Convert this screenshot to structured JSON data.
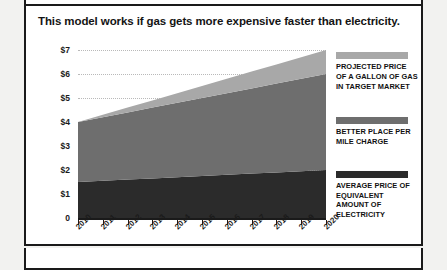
{
  "title": "This model works if gas gets more expensive faster than electricity.",
  "colors": {
    "gas": "#a8a8a8",
    "charge": "#6e6e6e",
    "electricity": "#2b2b2b",
    "gridline": "#b9b9b9",
    "axis": "#1a1a1a",
    "card_background": "#ffffff",
    "page_background": "#f2f2f0"
  },
  "legend": [
    {
      "key": "gas",
      "swatch": "#a8a8a8",
      "label": "PROJECTED PRICE OF A GALLON OF GAS IN TARGET MARKET"
    },
    {
      "key": "charge",
      "swatch": "#6e6e6e",
      "label": "BETTER PLACE PER MILE CHARGE"
    },
    {
      "key": "electricity",
      "swatch": "#2b2b2b",
      "label": "AVERAGE PRICE OF EQUIVALENT AMOUNT OF ELECTRICITY"
    }
  ],
  "chart_data": {
    "type": "area",
    "stacked": true,
    "title": "This model works if gas gets more expensive faster than electricity.",
    "xlabel": "",
    "ylabel": "",
    "categories": [
      "2010",
      "2011",
      "2012",
      "2013",
      "2014",
      "2015",
      "2016",
      "2017",
      "2018",
      "2019",
      "2020"
    ],
    "x": [
      2010,
      2011,
      2012,
      2013,
      2014,
      2015,
      2016,
      2017,
      2018,
      2019,
      2020
    ],
    "ylim": [
      0,
      7
    ],
    "xlim": [
      2010,
      2020
    ],
    "y_ticks": [
      0,
      1,
      2,
      3,
      4,
      5,
      6,
      7
    ],
    "y_tick_labels": [
      "0",
      "$1",
      "$2",
      "$3",
      "$4",
      "$5",
      "$6",
      "$7"
    ],
    "grid": true,
    "grid_axis": "y",
    "legend_position": "right",
    "series": [
      {
        "name": "AVERAGE PRICE OF EQUIVALENT AMOUNT OF ELECTRICITY",
        "color": "#2b2b2b",
        "values": [
          1.5,
          1.55,
          1.6,
          1.65,
          1.7,
          1.75,
          1.8,
          1.85,
          1.9,
          1.95,
          2.0
        ]
      },
      {
        "name": "BETTER PLACE PER MILE CHARGE",
        "color": "#6e6e6e",
        "values": [
          2.5,
          2.65,
          2.8,
          2.95,
          3.1,
          3.25,
          3.4,
          3.55,
          3.7,
          3.85,
          4.0
        ]
      },
      {
        "name": "PROJECTED PRICE OF A GALLON OF GAS IN TARGET MARKET",
        "color": "#a8a8a8",
        "values": [
          0.0,
          0.1,
          0.2,
          0.3,
          0.4,
          0.5,
          0.6,
          0.7,
          0.8,
          0.9,
          1.0
        ]
      }
    ],
    "cumulative_totals": [
      4.0,
      4.3,
      4.6,
      4.9,
      5.2,
      5.5,
      5.8,
      6.1,
      6.4,
      6.7,
      7.0
    ]
  }
}
